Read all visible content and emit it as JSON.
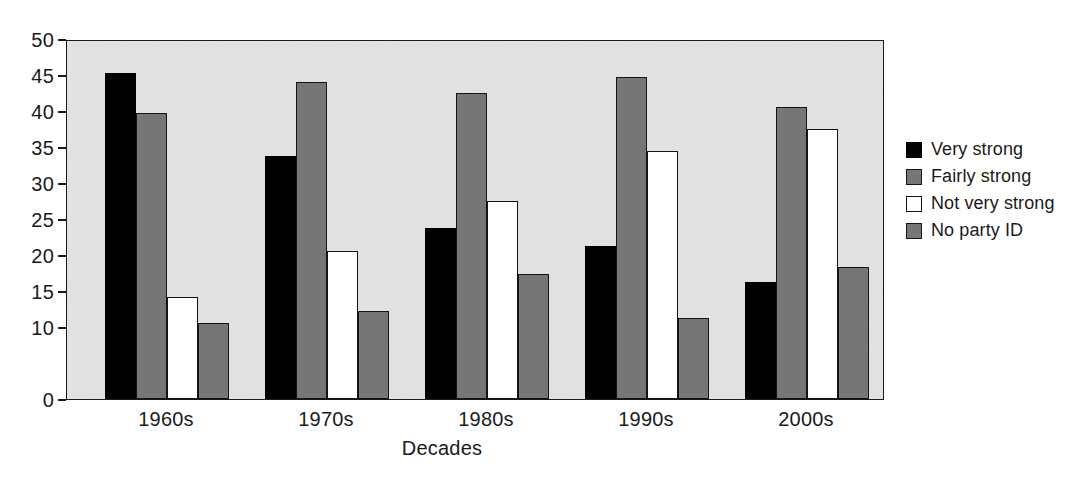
{
  "chart_data": {
    "type": "bar",
    "title": "",
    "subtitle": "",
    "xlabel": "Decades",
    "ylabel": "",
    "categories": [
      "1960s",
      "1970s",
      "1980s",
      "1990s",
      "2000s"
    ],
    "series": [
      {
        "name": "Very strong",
        "color": "#000000",
        "values": [
          45.3,
          33.7,
          23.7,
          21.2,
          16.3
        ]
      },
      {
        "name": "Fairly strong",
        "color": "#767676",
        "values": [
          39.7,
          44.0,
          42.5,
          44.7,
          40.6
        ]
      },
      {
        "name": "Not very strong",
        "color": "#ffffff",
        "values": [
          14.2,
          20.5,
          27.5,
          34.5,
          37.5
        ]
      },
      {
        "name": "No party ID",
        "color": "#767676",
        "values": [
          10.6,
          12.2,
          17.3,
          11.2,
          18.4
        ]
      }
    ],
    "ylim": [
      0,
      50
    ],
    "yticks": [
      0,
      10,
      15,
      20,
      25,
      30,
      35,
      40,
      45,
      50
    ],
    "ytick_labels": [
      "0",
      "10",
      "15",
      "20",
      "25",
      "30",
      "35",
      "40",
      "45",
      "50"
    ],
    "grid": false,
    "legend_position": "right",
    "plot_background": "#e3e3e3",
    "axis_color": "#1a1a1a"
  },
  "legend": {
    "items": [
      {
        "label": "Very strong"
      },
      {
        "label": "Fairly strong"
      },
      {
        "label": "Not very strong"
      },
      {
        "label": "No party ID"
      }
    ]
  },
  "axis": {
    "x_title": "Decades"
  }
}
